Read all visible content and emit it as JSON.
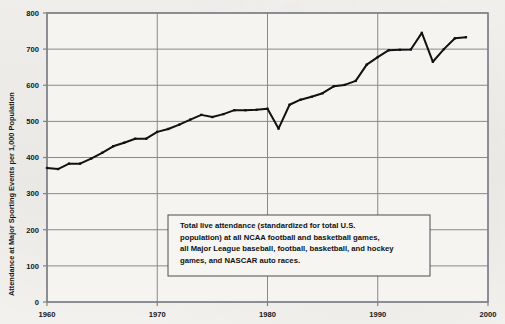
{
  "figure": {
    "background_color": "#f2f1ee",
    "plot_background_color": "#f5f4f1",
    "frame_color": "#7f8287",
    "gridline_color": "#86898e",
    "series_color": "#111111",
    "note_border_color": "#4a4d52"
  },
  "annotation": {
    "name": "definition-note",
    "lines": [
      "Total live attendance (standardized for total U.S.",
      "population) at all NCAA football and basketball games,",
      "all Major League baseball, football, basketball, and hockey",
      "games, and NASCAR auto races."
    ]
  },
  "chart_data": {
    "type": "line",
    "title": "",
    "xlabel": "",
    "ylabel": "Attendance at Major Sporting Events per 1,000 Population",
    "xlim": [
      1960,
      2000
    ],
    "ylim": [
      0,
      800
    ],
    "xticks": [
      1960,
      1970,
      1980,
      1990,
      2000
    ],
    "xtick_labels": [
      "1960",
      "1970",
      "1980",
      "1990",
      "2000"
    ],
    "yticks": [
      0,
      100,
      200,
      300,
      400,
      500,
      600,
      700,
      800
    ],
    "ytick_labels": [
      "0",
      "100",
      "200",
      "300",
      "400",
      "500",
      "600",
      "700",
      "800"
    ],
    "grid": "horizontal-and-vertical",
    "legend": "none",
    "markers": true,
    "series": [
      {
        "name": "Attendance per 1,000 population",
        "x": [
          1960,
          1961,
          1962,
          1963,
          1964,
          1965,
          1966,
          1967,
          1968,
          1969,
          1970,
          1971,
          1972,
          1973,
          1974,
          1975,
          1976,
          1977,
          1978,
          1979,
          1980,
          1981,
          1982,
          1983,
          1984,
          1985,
          1986,
          1987,
          1988,
          1989,
          1990,
          1991,
          1992,
          1993,
          1994,
          1995,
          1996,
          1997,
          1998
        ],
        "values": [
          371,
          368,
          383,
          383,
          397,
          413,
          431,
          441,
          452,
          452,
          471,
          479,
          491,
          505,
          518,
          512,
          520,
          531,
          531,
          532,
          535,
          480,
          546,
          560,
          568,
          578,
          597,
          601,
          612,
          657,
          678,
          697,
          698,
          699,
          745,
          665,
          700,
          730,
          733
        ]
      }
    ]
  }
}
